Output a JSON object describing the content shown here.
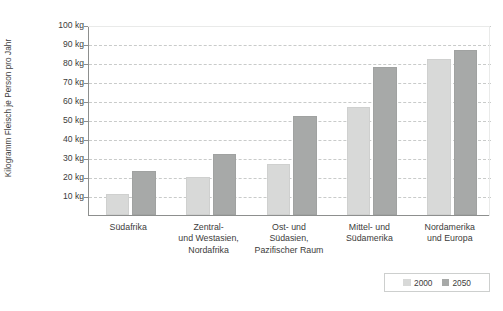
{
  "chart_data": {
    "type": "bar",
    "title": "",
    "subtitle": "",
    "xlabel": "",
    "ylabel": "Kilogramm Fleisch je Person pro Jahr",
    "ylim": [
      0,
      100
    ],
    "ytick_step": 10,
    "grid": true,
    "grid_style": "horizontal-dashed",
    "legend_position": "bottom-right",
    "unit_suffix": " kg",
    "ytick_labels": [
      "100 kg",
      "90 kg",
      "80 kg",
      "70 kg",
      "60 kg",
      "50 kg",
      "40 kg",
      "30 kg",
      "20 kg",
      "10 kg"
    ],
    "ytick_values": [
      100,
      90,
      80,
      70,
      60,
      50,
      40,
      30,
      20,
      10
    ],
    "categories": [
      "Südafrika",
      "Zentral-\nund Westasien,\nNordafrika",
      "Ost- und\nSüdasien,\nPazifischer Raum",
      "Mittel- und\nSüdamerika",
      "Nordamerika\nund Europa"
    ],
    "category_lines": [
      [
        "Südafrika"
      ],
      [
        "Zentral-",
        "und Westasien,",
        "Nordafrika"
      ],
      [
        "Ost- und",
        "Südasien,",
        "Pazifischer Raum"
      ],
      [
        "Mittel- und",
        "Südamerika"
      ],
      [
        "Nordamerika",
        "und Europa"
      ]
    ],
    "series": [
      {
        "name": "2000",
        "color": "#d8d9d8",
        "values": [
          11,
          20,
          27,
          57,
          82
        ]
      },
      {
        "name": "2050",
        "color": "#a7a9a8",
        "values": [
          23,
          32,
          52,
          78,
          87
        ]
      }
    ]
  },
  "legend": {
    "items": [
      {
        "label": "2000",
        "color": "#d8d9d8"
      },
      {
        "label": "2050",
        "color": "#a7a9a8"
      }
    ]
  },
  "axis": {
    "y_title": "Kilogramm Fleisch je Person pro Jahr"
  },
  "colors": {
    "series_2000": "#d8d9d8",
    "series_2050": "#a7a9a8",
    "axis_line": "#8d8f8e",
    "gridline": "#c9cbca",
    "text": "#3c3c3b",
    "background": "#ffffff"
  }
}
